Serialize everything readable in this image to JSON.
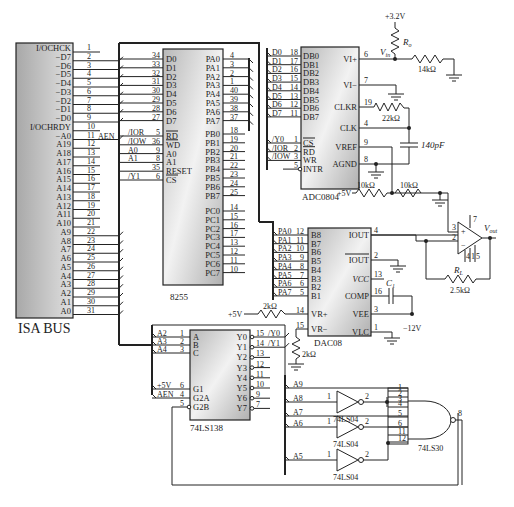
{
  "isa_bus": {
    "label": "ISA BUS",
    "pins": [
      {
        "name": "I/OCHCK",
        "num": "1"
      },
      {
        "name": "−D7",
        "num": "2"
      },
      {
        "name": "−D6",
        "num": "3"
      },
      {
        "name": "−D5",
        "num": "4"
      },
      {
        "name": "−D4",
        "num": "5"
      },
      {
        "name": "−D3",
        "num": "6"
      },
      {
        "name": "−D2",
        "num": "7"
      },
      {
        "name": "−D1",
        "num": "8"
      },
      {
        "name": "−D0",
        "num": "9"
      },
      {
        "name": "I/OCHRDY",
        "num": "10"
      },
      {
        "name": "−A0",
        "num": "11"
      },
      {
        "name": "A19",
        "num": "12"
      },
      {
        "name": "A18",
        "num": "13"
      },
      {
        "name": "A17",
        "num": "14"
      },
      {
        "name": "A16",
        "num": "15"
      },
      {
        "name": "A15",
        "num": "16"
      },
      {
        "name": "A14",
        "num": "17"
      },
      {
        "name": "A13",
        "num": "18"
      },
      {
        "name": "A12",
        "num": "19"
      },
      {
        "name": "A11",
        "num": "20"
      },
      {
        "name": "A10",
        "num": "21"
      },
      {
        "name": "A9",
        "num": "22"
      },
      {
        "name": "A8",
        "num": "23"
      },
      {
        "name": "A7",
        "num": "24"
      },
      {
        "name": "A6",
        "num": "25"
      },
      {
        "name": "A5",
        "num": "26"
      },
      {
        "name": "A4",
        "num": "27"
      },
      {
        "name": "A3",
        "num": "28"
      },
      {
        "name": "A2",
        "num": "29"
      },
      {
        "name": "A1",
        "num": "30"
      },
      {
        "name": "A0",
        "num": "31"
      }
    ],
    "aen_label": "AEN"
  },
  "chip_8255": {
    "label": "8255",
    "left_pins": [
      {
        "name": "D0",
        "num": "34"
      },
      {
        "name": "D1",
        "num": "33"
      },
      {
        "name": "D2",
        "num": "32"
      },
      {
        "name": "D3",
        "num": "31"
      },
      {
        "name": "D4",
        "num": "30"
      },
      {
        "name": "D5",
        "num": "29"
      },
      {
        "name": "D6",
        "num": "28"
      },
      {
        "name": "D7",
        "num": "27"
      },
      {
        "name": "RD",
        "num": "5",
        "sig": "/IOR"
      },
      {
        "name": "WD",
        "num": "36",
        "sig": "/IOW"
      },
      {
        "name": "A0",
        "num": "9",
        "sig": "A0"
      },
      {
        "name": "A1",
        "num": "8",
        "sig": "A1"
      },
      {
        "name": "RESET",
        "num": "35",
        "sig": ""
      },
      {
        "name": "CS",
        "num": "6",
        "sig": "/Y1"
      }
    ],
    "right_pins": [
      {
        "name": "PA0",
        "num": "4"
      },
      {
        "name": "PA1",
        "num": "3"
      },
      {
        "name": "PA2",
        "num": "2"
      },
      {
        "name": "PA3",
        "num": "1"
      },
      {
        "name": "PA4",
        "num": "40"
      },
      {
        "name": "PA5",
        "num": "39"
      },
      {
        "name": "PA6",
        "num": "38"
      },
      {
        "name": "PA7",
        "num": "37"
      },
      {
        "name": "PB0",
        "num": "18"
      },
      {
        "name": "PB1",
        "num": "19"
      },
      {
        "name": "PB2",
        "num": "20"
      },
      {
        "name": "PB3",
        "num": "21"
      },
      {
        "name": "PB4",
        "num": "22"
      },
      {
        "name": "PB5",
        "num": "23"
      },
      {
        "name": "PB6",
        "num": "24"
      },
      {
        "name": "PB7",
        "num": "25"
      },
      {
        "name": "PC0",
        "num": "14"
      },
      {
        "name": "PC1",
        "num": "15"
      },
      {
        "name": "PC2",
        "num": "16"
      },
      {
        "name": "PC3",
        "num": "17"
      },
      {
        "name": "PC4",
        "num": "13"
      },
      {
        "name": "PC5",
        "num": "12"
      },
      {
        "name": "PC6",
        "num": "11"
      },
      {
        "name": "PC7",
        "num": "10"
      }
    ]
  },
  "adc0804": {
    "label": "ADC0804",
    "left_pins": [
      {
        "name": "DB0",
        "num": "18",
        "sig": "D0"
      },
      {
        "name": "DB1",
        "num": "17",
        "sig": "D1"
      },
      {
        "name": "DB2",
        "num": "16",
        "sig": "D2"
      },
      {
        "name": "DB3",
        "num": "15",
        "sig": "D3"
      },
      {
        "name": "DB4",
        "num": "14",
        "sig": "D4"
      },
      {
        "name": "DB5",
        "num": "13",
        "sig": "D5"
      },
      {
        "name": "DB6",
        "num": "12",
        "sig": "D6"
      },
      {
        "name": "DB7",
        "num": "11",
        "sig": "D7"
      },
      {
        "name": "CS",
        "num": "1",
        "sig": "/Y0"
      },
      {
        "name": "RD",
        "num": "2",
        "sig": "/IOR"
      },
      {
        "name": "WR",
        "num": "3",
        "sig": "/IOW"
      },
      {
        "name": "INTR",
        "num": "5",
        "sig": ""
      }
    ],
    "right_pins": [
      {
        "name": "VI+",
        "num": "6"
      },
      {
        "name": "VI−",
        "num": "7"
      },
      {
        "name": "CLKR",
        "num": "19"
      },
      {
        "name": "CLK",
        "num": "4"
      },
      {
        "name": "VREF",
        "num": "9"
      },
      {
        "name": "AGND",
        "num": "8"
      }
    ]
  },
  "adc_circuit": {
    "supply": "+3.2V",
    "ro_label": "R",
    "ro_sub": "o",
    "vin_label": "V",
    "vin_sub": "in",
    "r_14k": "14kΩ",
    "r_22k": "22kΩ",
    "c_140p": "140pF",
    "vref_supply": "+5V",
    "r_10k_a": "10kΩ",
    "r_10k_b": "10kΩ"
  },
  "dac08": {
    "label": "DAC08",
    "left_pins": [
      {
        "name": "B8",
        "num": "12",
        "sig": "PA0"
      },
      {
        "name": "B7",
        "num": "11",
        "sig": "PA1"
      },
      {
        "name": "B6",
        "num": "10",
        "sig": "PA2"
      },
      {
        "name": "B5",
        "num": "9",
        "sig": "PA3"
      },
      {
        "name": "B4",
        "num": "8",
        "sig": "PA4"
      },
      {
        "name": "B3",
        "num": "7",
        "sig": "PA5"
      },
      {
        "name": "B2",
        "num": "6",
        "sig": "PA6"
      },
      {
        "name": "B1",
        "num": "5",
        "sig": "PA7"
      },
      {
        "name": "VR+",
        "num": "14"
      },
      {
        "name": "VR−",
        "num": "15"
      }
    ],
    "right_pins": [
      {
        "name": "IOUT",
        "num": "4"
      },
      {
        "name": "IOUT",
        "num": "2"
      },
      {
        "name": "VCC",
        "num": "13"
      },
      {
        "name": "COMP",
        "num": "16"
      },
      {
        "name": "VEE",
        "num": "3"
      },
      {
        "name": "VLC",
        "num": "1"
      }
    ]
  },
  "dac_circuit": {
    "vr_supply": "+5V",
    "r_2k_a": "2kΩ",
    "r_2k_b": "2kΩ",
    "c1_label": "C",
    "c1_sub": "1",
    "vee_supply": "−12V",
    "rl_label": "R",
    "rl_sub": "L",
    "rl_value": "2.5kΩ",
    "vout_label": "V",
    "vout_sub": "out",
    "opamp_pins": {
      "plus": "3",
      "minus": "2",
      "top": "7",
      "b1": "4",
      "b2": "1",
      "b3": "5"
    }
  },
  "ls138": {
    "label": "74LS138",
    "left_pins": [
      {
        "name": "A",
        "num": "1",
        "sig": "A2"
      },
      {
        "name": "B",
        "num": "2",
        "sig": "A3"
      },
      {
        "name": "C",
        "num": "3",
        "sig": "A4"
      },
      {
        "name": "G1",
        "num": "6",
        "sig": "+5V"
      },
      {
        "name": "G2A",
        "num": "4",
        "sig": "AEN"
      },
      {
        "name": "G2B",
        "num": "5",
        "sig": ""
      }
    ],
    "right_pins": [
      {
        "name": "Y0",
        "num": "15",
        "sig": "/Y0"
      },
      {
        "name": "Y1",
        "num": "14",
        "sig": "/Y1"
      },
      {
        "name": "Y2",
        "num": "13",
        "sig": ""
      },
      {
        "name": "Y3",
        "num": "12",
        "sig": ""
      },
      {
        "name": "Y4",
        "num": "11",
        "sig": ""
      },
      {
        "name": "Y5",
        "num": "10",
        "sig": ""
      },
      {
        "name": "Y6",
        "num": "9",
        "sig": ""
      },
      {
        "name": "Y7",
        "num": "7",
        "sig": ""
      }
    ]
  },
  "logic": {
    "inputs": [
      "A9",
      "A8",
      "A7",
      "A6",
      "A5"
    ],
    "inverter_label": "74LS04",
    "inv_in": "1",
    "inv_out": "2",
    "nand_label": "74LS30",
    "nand_pins": [
      "1",
      "2",
      "3",
      "4",
      "5",
      "6",
      "11",
      "12"
    ],
    "nand_out": "8"
  }
}
